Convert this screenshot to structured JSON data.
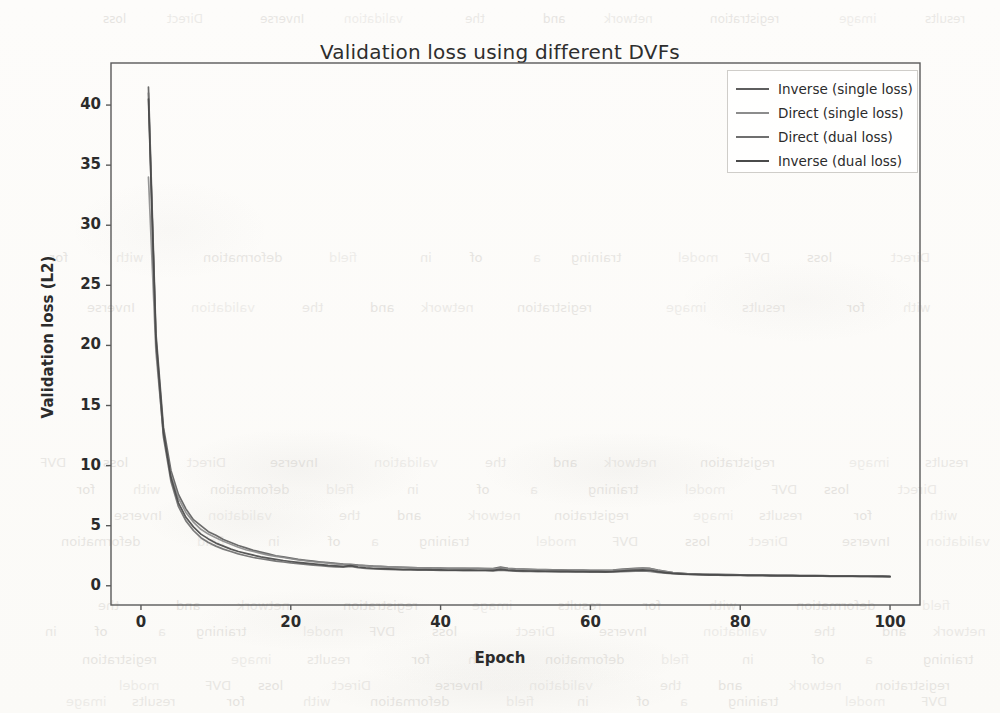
{
  "chart_data": {
    "type": "line",
    "title": "Validation loss using different DVFs",
    "xlabel": "Epoch",
    "ylabel": "Validation loss (L2)",
    "xlim": [
      -4,
      104
    ],
    "ylim": [
      -1.6,
      43.5
    ],
    "xticks": [
      0,
      20,
      40,
      60,
      80,
      100
    ],
    "yticks": [
      0,
      5,
      10,
      15,
      20,
      25,
      30,
      35,
      40
    ],
    "grid": false,
    "legend_position": "upper right",
    "x": [
      1,
      2,
      3,
      4,
      5,
      6,
      7,
      8,
      9,
      10,
      11,
      12,
      13,
      14,
      15,
      16,
      17,
      18,
      19,
      20,
      21,
      22,
      23,
      24,
      25,
      26,
      27,
      28,
      29,
      30,
      31,
      32,
      33,
      34,
      35,
      36,
      37,
      38,
      39,
      40,
      41,
      42,
      43,
      44,
      45,
      46,
      47,
      48,
      49,
      50,
      51,
      52,
      53,
      54,
      55,
      56,
      57,
      58,
      59,
      60,
      61,
      62,
      63,
      64,
      65,
      66,
      67,
      68,
      69,
      70,
      71,
      72,
      73,
      74,
      75,
      76,
      77,
      78,
      79,
      80,
      81,
      82,
      83,
      84,
      85,
      86,
      87,
      88,
      89,
      90,
      91,
      92,
      93,
      94,
      95,
      96,
      97,
      98,
      99,
      100
    ],
    "series": [
      {
        "name": "Inverse (single loss)",
        "color": "#5e5e5e",
        "values": [
          41.5,
          21.0,
          13.2,
          9.6,
          7.6,
          6.4,
          5.5,
          5.0,
          4.5,
          4.2,
          3.85,
          3.6,
          3.35,
          3.15,
          2.95,
          2.8,
          2.65,
          2.5,
          2.4,
          2.3,
          2.2,
          2.12,
          2.05,
          1.98,
          1.92,
          1.86,
          1.8,
          1.78,
          1.72,
          1.68,
          1.64,
          1.62,
          1.58,
          1.56,
          1.54,
          1.52,
          1.5,
          1.5,
          1.48,
          1.47,
          1.46,
          1.45,
          1.45,
          1.44,
          1.44,
          1.43,
          1.43,
          1.55,
          1.45,
          1.4,
          1.38,
          1.36,
          1.35,
          1.34,
          1.33,
          1.32,
          1.31,
          1.3,
          1.3,
          1.29,
          1.28,
          1.28,
          1.3,
          1.36,
          1.4,
          1.44,
          1.48,
          1.44,
          1.3,
          1.2,
          1.1,
          1.05,
          1.0,
          0.98,
          0.96,
          0.95,
          0.94,
          0.93,
          0.92,
          0.91,
          0.9,
          0.89,
          0.88,
          0.88,
          0.87,
          0.86,
          0.86,
          0.85,
          0.85,
          0.84,
          0.84,
          0.83,
          0.83,
          0.82,
          0.82,
          0.81,
          0.81,
          0.8,
          0.8,
          0.78
        ]
      },
      {
        "name": "Direct (single loss)",
        "color": "#8c8c8c",
        "values": [
          34.0,
          19.5,
          12.6,
          9.2,
          7.3,
          6.1,
          5.3,
          4.7,
          4.3,
          4.0,
          3.7,
          3.45,
          3.2,
          3.0,
          2.85,
          2.7,
          2.55,
          2.45,
          2.35,
          2.25,
          2.15,
          2.08,
          2.0,
          1.94,
          1.88,
          1.82,
          1.78,
          1.74,
          1.7,
          1.66,
          1.63,
          1.6,
          1.57,
          1.55,
          1.53,
          1.51,
          1.5,
          1.49,
          1.47,
          1.46,
          1.45,
          1.44,
          1.44,
          1.43,
          1.42,
          1.42,
          1.41,
          1.48,
          1.42,
          1.38,
          1.36,
          1.34,
          1.33,
          1.32,
          1.31,
          1.3,
          1.29,
          1.29,
          1.28,
          1.27,
          1.27,
          1.26,
          1.28,
          1.33,
          1.37,
          1.41,
          1.44,
          1.4,
          1.28,
          1.18,
          1.09,
          1.04,
          1.0,
          0.97,
          0.95,
          0.94,
          0.93,
          0.92,
          0.91,
          0.9,
          0.89,
          0.89,
          0.88,
          0.87,
          0.86,
          0.86,
          0.85,
          0.85,
          0.84,
          0.84,
          0.83,
          0.83,
          0.82,
          0.82,
          0.81,
          0.81,
          0.8,
          0.8,
          0.79,
          0.77
        ]
      },
      {
        "name": "Direct (dual loss)",
        "color": "#6f6f6f",
        "values": [
          41.0,
          20.2,
          12.4,
          8.7,
          6.6,
          5.4,
          4.6,
          4.0,
          3.6,
          3.3,
          3.05,
          2.85,
          2.65,
          2.5,
          2.35,
          2.25,
          2.15,
          2.05,
          1.98,
          1.9,
          1.84,
          1.78,
          1.72,
          1.68,
          1.62,
          1.58,
          1.54,
          1.62,
          1.5,
          1.44,
          1.4,
          1.38,
          1.36,
          1.34,
          1.33,
          1.32,
          1.3,
          1.3,
          1.29,
          1.28,
          1.27,
          1.27,
          1.26,
          1.26,
          1.25,
          1.25,
          1.24,
          1.3,
          1.25,
          1.22,
          1.2,
          1.19,
          1.18,
          1.17,
          1.17,
          1.16,
          1.16,
          1.15,
          1.15,
          1.14,
          1.14,
          1.13,
          1.15,
          1.18,
          1.2,
          1.22,
          1.24,
          1.2,
          1.12,
          1.05,
          1.0,
          0.97,
          0.94,
          0.92,
          0.9,
          0.89,
          0.88,
          0.87,
          0.86,
          0.86,
          0.85,
          0.84,
          0.84,
          0.83,
          0.83,
          0.82,
          0.82,
          0.81,
          0.81,
          0.8,
          0.8,
          0.79,
          0.79,
          0.78,
          0.78,
          0.77,
          0.77,
          0.76,
          0.76,
          0.75
        ]
      },
      {
        "name": "Inverse (dual loss)",
        "color": "#4a4a4a",
        "values": [
          40.5,
          20.6,
          12.8,
          9.0,
          6.9,
          5.7,
          4.9,
          4.3,
          3.9,
          3.55,
          3.3,
          3.05,
          2.85,
          2.7,
          2.55,
          2.4,
          2.3,
          2.2,
          2.1,
          2.02,
          1.95,
          1.88,
          1.82,
          1.76,
          1.7,
          1.66,
          1.62,
          1.68,
          1.56,
          1.5,
          1.46,
          1.43,
          1.41,
          1.39,
          1.37,
          1.36,
          1.35,
          1.34,
          1.33,
          1.32,
          1.31,
          1.31,
          1.3,
          1.3,
          1.29,
          1.29,
          1.28,
          1.36,
          1.3,
          1.26,
          1.24,
          1.23,
          1.22,
          1.21,
          1.2,
          1.2,
          1.19,
          1.18,
          1.18,
          1.17,
          1.17,
          1.16,
          1.18,
          1.22,
          1.26,
          1.3,
          1.33,
          1.29,
          1.18,
          1.1,
          1.03,
          0.99,
          0.96,
          0.94,
          0.92,
          0.91,
          0.9,
          0.89,
          0.88,
          0.88,
          0.87,
          0.86,
          0.86,
          0.85,
          0.85,
          0.84,
          0.84,
          0.83,
          0.83,
          0.82,
          0.82,
          0.81,
          0.81,
          0.8,
          0.8,
          0.79,
          0.79,
          0.78,
          0.78,
          0.76
        ]
      }
    ]
  },
  "legend": {
    "items": [
      {
        "label": "Inverse (single loss)"
      },
      {
        "label": "Direct (single loss)"
      },
      {
        "label": "Direct (dual loss)"
      },
      {
        "label": "Inverse (dual loss)"
      }
    ]
  },
  "axis": {
    "xtick_labels": [
      "0",
      "20",
      "40",
      "60",
      "80",
      "100"
    ],
    "ytick_labels": [
      "0",
      "5",
      "10",
      "15",
      "20",
      "25",
      "30",
      "35",
      "40"
    ]
  },
  "page_artifacts": {
    "ghost_text": [
      "DVF",
      "loss",
      "Direct",
      "Inverse",
      "validation",
      "the",
      "and",
      "network",
      "registration",
      "image",
      "results",
      "for",
      "with",
      "deformation",
      "field",
      "in",
      "of",
      "a",
      "training",
      "model"
    ]
  }
}
